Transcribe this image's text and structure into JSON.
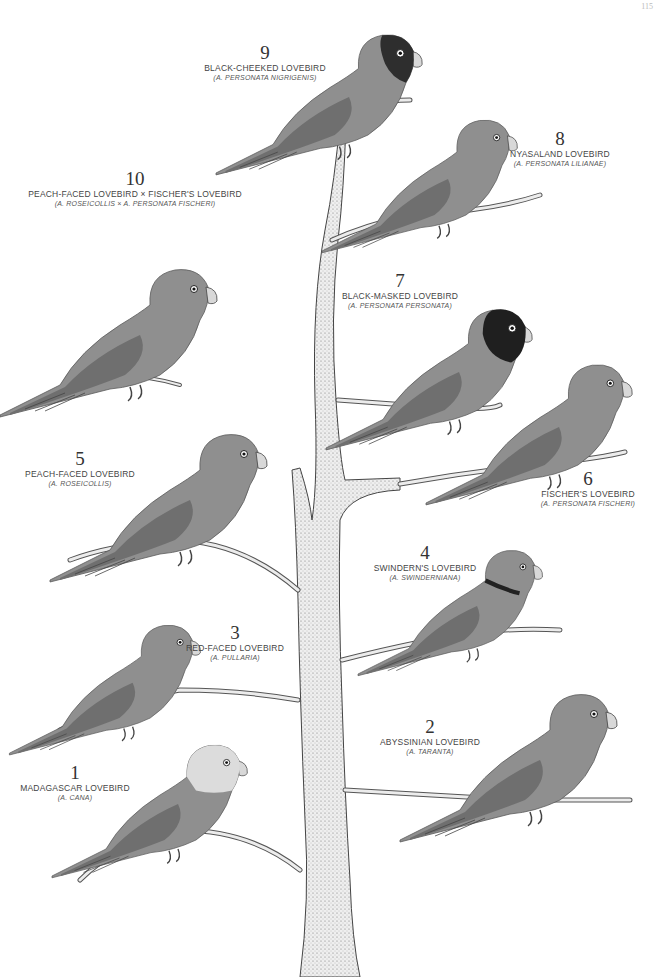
{
  "page": {
    "number": "115"
  },
  "colors": {
    "bird_body": "#8f8f8f",
    "bird_dark": "#3a3a3a",
    "wing": "#6f6f6f",
    "branch": "#ececec",
    "branch_outline": "#555555"
  },
  "birds": [
    {
      "num": "1",
      "common": "MADAGASCAR LOVEBIRD",
      "sci": "(A. CANA)"
    },
    {
      "num": "2",
      "common": "ABYSSINIAN LOVEBIRD",
      "sci": "(A. TARANTA)"
    },
    {
      "num": "3",
      "common": "RED-FACED LOVEBIRD",
      "sci": "(A. PULLARIA)"
    },
    {
      "num": "4",
      "common": "SWINDERN'S LOVEBIRD",
      "sci": "(A. SWINDERNIANA)"
    },
    {
      "num": "5",
      "common": "PEACH-FACED LOVEBIRD",
      "sci": "(A. ROSEICOLLIS)"
    },
    {
      "num": "6",
      "common": "FISCHER'S LOVEBIRD",
      "sci": "(A. PERSONATA FISCHERI)"
    },
    {
      "num": "7",
      "common": "BLACK-MASKED LOVEBIRD",
      "sci": "(A. PERSONATA PERSONATA)"
    },
    {
      "num": "8",
      "common": "NYASALAND LOVEBIRD",
      "sci": "(A. PERSONATA LILIANAE)"
    },
    {
      "num": "9",
      "common": "BLACK-CHEEKED LOVEBIRD",
      "sci": "(A. PERSONATA NIGRIGENIS)"
    },
    {
      "num": "10",
      "common": "PEACH-FACED LOVEBIRD × FISCHER'S LOVEBIRD",
      "sci": "(A. ROSEICOLLIS × A. PERSONATA FISCHERI)"
    }
  ]
}
